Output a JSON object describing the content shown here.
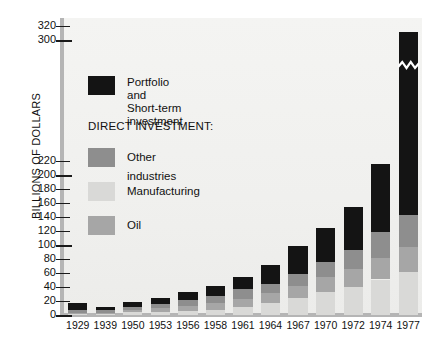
{
  "chart_data": {
    "type": "bar",
    "stacked": true,
    "title": "",
    "xlabel": "",
    "ylabel": "BILLIONS OF DOLLARS",
    "categories": [
      "1929",
      "1939",
      "1950",
      "1953",
      "1956",
      "1958",
      "1961",
      "1964",
      "1967",
      "1970",
      "1972",
      "1974",
      "1977"
    ],
    "ylim": [
      0,
      320
    ],
    "yticks": [
      0,
      20,
      40,
      60,
      80,
      100,
      120,
      140,
      160,
      180,
      200,
      220,
      300,
      320
    ],
    "ytick_labels": [
      "0",
      "20",
      "40",
      "60",
      "80",
      "100",
      "120",
      "140",
      "160",
      "180",
      "200",
      "220",
      "300",
      "320"
    ],
    "axis_break": {
      "present": true,
      "between": [
        220,
        300
      ],
      "note": "y-axis is broken between 220 and 300"
    },
    "bar_break_marker": {
      "category": "1977",
      "series": "Portfolio and Short-term investment",
      "note": "white zigzag break symbol drawn across the top black segment"
    },
    "grid": false,
    "legend_position": "inside-upper-left",
    "series": [
      {
        "name": "Oil",
        "color": "#a6a6a6",
        "values": [
          1.1,
          1.4,
          3.4,
          4.7,
          7.2,
          9.1,
          12.2,
          14.7,
          17.4,
          21.7,
          26.4,
          31.4,
          35.2
        ]
      },
      {
        "name": "Manufacturing",
        "color": "#d9d9d7",
        "values": [
          1.8,
          1.8,
          3.8,
          4.6,
          6.3,
          7.8,
          11.0,
          16.9,
          24.2,
          32.3,
          39.5,
          50.7,
          62.0
        ]
      },
      {
        "name": "Other industries",
        "color": "#8e8e8e",
        "values": [
          4.6,
          3.8,
          4.6,
          6.3,
          8.6,
          10.4,
          13.3,
          12.7,
          17.1,
          21.7,
          27.2,
          36.5,
          45.3
        ]
      },
      {
        "name": "Portfolio and Short-term investment",
        "color": "#141414",
        "values": [
          9.5,
          4.5,
          7.2,
          8.4,
          10.9,
          13.7,
          18.5,
          26.7,
          40.3,
          49.3,
          60.9,
          97.4,
          168.5
        ]
      }
    ],
    "totals": [
      17.0,
      11.5,
      19.0,
      24.0,
      33.0,
      41.0,
      55.0,
      71.0,
      99.0,
      125.0,
      154.0,
      216.0,
      311.0
    ]
  },
  "legend": {
    "items": [
      {
        "label": "Portfolio and\nShort-term investment",
        "color": "#141414",
        "name": "portfolio"
      },
      {
        "label": "Other industries",
        "color": "#8e8e8e",
        "name": "other-industries"
      },
      {
        "label": "Manufacturing",
        "color": "#d9d9d7",
        "name": "manufacturing"
      },
      {
        "label": "Oil",
        "color": "#a6a6a6",
        "name": "oil"
      }
    ],
    "header": "DIRECT INVESTMENT:"
  },
  "axis": {
    "y_title": "BILLIONS OF DOLLARS"
  },
  "colors": {
    "panel": "#f2f2f0",
    "axis": "#b5b5b5",
    "text": "#111111"
  }
}
